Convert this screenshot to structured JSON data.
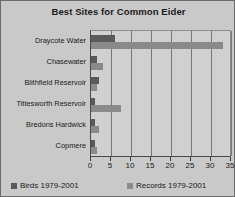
{
  "chart_data": {
    "type": "bar",
    "orientation": "horizontal",
    "title": "Best Sites for Common Eider",
    "xlabel": "",
    "ylabel": "",
    "xlim": [
      0,
      35
    ],
    "xticks": [
      0,
      5,
      10,
      15,
      20,
      25,
      30,
      35
    ],
    "grid": true,
    "legend_position": "bottom",
    "categories": [
      "Draycote Water",
      "Chasewater",
      "Blithfield Reservoir",
      "Tittesworth Reservoir",
      "Bredons Hardwick",
      "Copmere"
    ],
    "series": [
      {
        "name": "Birds 1979-2001",
        "color": "#5a5a5a",
        "values": [
          6,
          1.5,
          2,
          1,
          1,
          1
        ]
      },
      {
        "name": "Records 1979-2001",
        "color": "#8a8a8a",
        "values": [
          33,
          3,
          1.5,
          7.5,
          2,
          1.5
        ]
      }
    ]
  },
  "legend": {
    "entries": [
      {
        "label": "Birds 1979-2001",
        "color": "#5a5a5a"
      },
      {
        "label": "Records 1979-2001",
        "color": "#8a8a8a"
      }
    ]
  }
}
